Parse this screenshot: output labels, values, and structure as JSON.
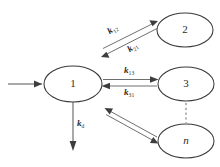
{
  "diagram": {
    "type": "state-transition-kinetic-scheme",
    "title": "",
    "background_color": "#ffffff",
    "stroke_color": "#3a3a3a",
    "nodes": [
      {
        "id": "state-1",
        "label": "1",
        "italic": false,
        "cx": 73,
        "cy": 84,
        "rx": 29,
        "ry": 18
      },
      {
        "id": "state-2",
        "label": "2",
        "italic": false,
        "cx": 185,
        "cy": 30,
        "rx": 28,
        "ry": 17
      },
      {
        "id": "state-3",
        "label": "3",
        "italic": false,
        "cx": 186,
        "cy": 84,
        "rx": 28,
        "ry": 17
      },
      {
        "id": "state-n",
        "label": "n",
        "italic": true,
        "cx": 186,
        "cy": 141,
        "rx": 28,
        "ry": 17
      }
    ],
    "edges": [
      {
        "id": "input-arrow",
        "from": "external",
        "to": "state-1",
        "label": "",
        "style": "solid",
        "direction": "right"
      },
      {
        "id": "edge-1-to-2",
        "from": "state-1",
        "to": "state-2",
        "label": "k12",
        "style": "solid",
        "direction": "up-right"
      },
      {
        "id": "edge-2-to-1",
        "from": "state-2",
        "to": "state-1",
        "label": "k21",
        "style": "solid",
        "direction": "down-left"
      },
      {
        "id": "edge-1-to-3",
        "from": "state-1",
        "to": "state-3",
        "label": "k13",
        "style": "solid",
        "direction": "right"
      },
      {
        "id": "edge-3-to-1",
        "from": "state-3",
        "to": "state-1",
        "label": "k31",
        "style": "solid",
        "direction": "left"
      },
      {
        "id": "edge-1-decay",
        "from": "state-1",
        "to": "external",
        "label": "kd",
        "style": "solid",
        "direction": "down"
      },
      {
        "id": "edge-1-to-n",
        "from": "state-1",
        "to": "state-n",
        "label": "",
        "style": "solid",
        "direction": "down-right"
      },
      {
        "id": "edge-n-to-1",
        "from": "state-n",
        "to": "state-1",
        "label": "",
        "style": "solid",
        "direction": "up-left"
      },
      {
        "id": "ellipsis-3-to-n",
        "from": "state-3",
        "to": "state-n",
        "label": "",
        "style": "dashed",
        "direction": "none"
      }
    ],
    "rate_labels": {
      "k12": {
        "symbol": "k",
        "subscript": "12",
        "x": 113,
        "y": 30
      },
      "k21": {
        "symbol": "k",
        "subscript": "21",
        "x": 133,
        "y": 48
      },
      "k13": {
        "symbol": "k",
        "subscript": "13",
        "x": 126,
        "y": 68
      },
      "k31": {
        "symbol": "k",
        "subscript": "31",
        "x": 126,
        "y": 90
      },
      "kd": {
        "symbol": "k",
        "subscript": "d",
        "x": 79,
        "y": 122
      }
    }
  }
}
